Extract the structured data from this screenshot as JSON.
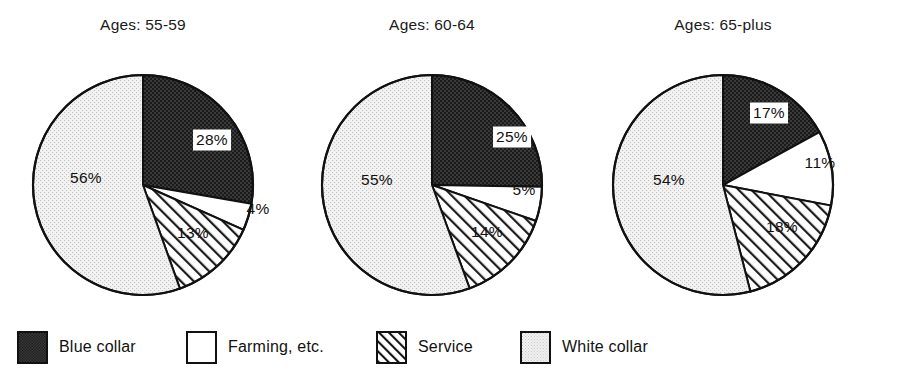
{
  "chart_data": {
    "type": "pie",
    "title": "",
    "chart_count": 3,
    "categories": [
      "Blue collar",
      "Farming, etc.",
      "Service",
      "White collar"
    ],
    "legend_position": "bottom",
    "charts": [
      {
        "title": "Ages: 55-59",
        "labels": [
          "Blue collar",
          "Farming, etc.",
          "Service",
          "White collar"
        ],
        "values": [
          28,
          4,
          13,
          56
        ],
        "value_labels": [
          "28%",
          "4%",
          "13%",
          "56%"
        ]
      },
      {
        "title": "Ages: 60-64",
        "labels": [
          "Blue collar",
          "Farming, etc.",
          "Service",
          "White collar"
        ],
        "values": [
          25,
          5,
          14,
          55
        ],
        "value_labels": [
          "25%",
          "5%",
          "14%",
          "55%"
        ]
      },
      {
        "title": "Ages: 65-plus",
        "labels": [
          "Blue collar",
          "Farming, etc.",
          "Service",
          "White collar"
        ],
        "values": [
          17,
          11,
          18,
          54
        ],
        "value_labels": [
          "17%",
          "11%",
          "18%",
          "54%"
        ]
      }
    ],
    "series": [
      {
        "name": "Ages: 55-59",
        "values": [
          28,
          4,
          13,
          56
        ]
      },
      {
        "name": "Ages: 60-64",
        "values": [
          25,
          5,
          14,
          55
        ]
      },
      {
        "name": "Ages: 65-plus",
        "values": [
          17,
          11,
          18,
          54
        ]
      }
    ]
  },
  "pies": [
    {
      "title": "Ages: 55-59"
    },
    {
      "title": "Ages: 60-64"
    },
    {
      "title": "Ages: 65-plus"
    }
  ],
  "labels": {
    "p0s0": "28%",
    "p0s1": "4%",
    "p0s2": "13%",
    "p0s3": "56%",
    "p1s0": "25%",
    "p1s1": "5%",
    "p1s2": "14%",
    "p1s3": "55%",
    "p2s0": "17%",
    "p2s1": "11%",
    "p2s2": "18%",
    "p2s3": "54%"
  },
  "legend": {
    "items": [
      {
        "label": "Blue collar",
        "pattern": "dark-checker"
      },
      {
        "label": "Farming, etc.",
        "pattern": "solid-white"
      },
      {
        "label": "Service",
        "pattern": "diagonal-hatch"
      },
      {
        "label": "White collar",
        "pattern": "light-dots"
      }
    ]
  },
  "colors": {
    "outline": "#111111",
    "blue_collar_fill": "#3b3b3b",
    "farming_fill": "#ffffff",
    "service_fill": "#ffffff",
    "white_collar_fill": "#ececec",
    "text": "#111111"
  }
}
